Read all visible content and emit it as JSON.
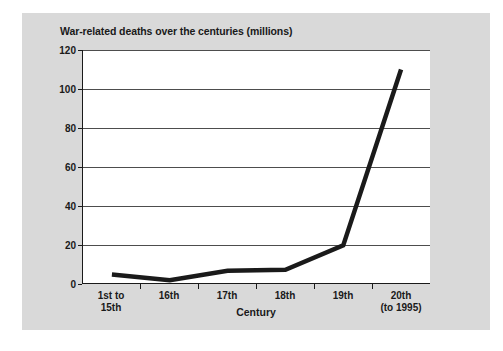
{
  "figure": {
    "background_color": "#d9d9d9",
    "plot_background_color": "#ffffff",
    "line_color": "#1a1a1a",
    "gridline_color": "#4d4d4d"
  },
  "chart_data": {
    "type": "line",
    "title": "War-related deaths over the centuries (millions)",
    "xlabel": "Century",
    "ylabel": "",
    "categories": [
      "1st to\n15th",
      "16th",
      "17th",
      "18th",
      "19th",
      "20th\n(to 1995)"
    ],
    "category_lines": [
      [
        "1st to",
        "15th"
      ],
      [
        "16th",
        ""
      ],
      [
        "17th",
        ""
      ],
      [
        "18th",
        ""
      ],
      [
        "19th",
        ""
      ],
      [
        "20th",
        "(to 1995)"
      ]
    ],
    "values": [
      4.5,
      1.6,
      6.5,
      7,
      19.5,
      110
    ],
    "ylim": [
      0,
      120
    ],
    "yticks": [
      0,
      20,
      40,
      60,
      80,
      100,
      120
    ],
    "ytick_labels": [
      "0",
      "20",
      "40",
      "60",
      "80",
      "100",
      "120"
    ],
    "grid": true,
    "legend": "none",
    "units": "millions"
  }
}
